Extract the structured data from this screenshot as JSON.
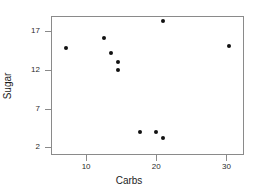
{
  "chart_data": {
    "type": "scatter",
    "title": "",
    "xlabel": "Carbs",
    "ylabel": "Sugar",
    "xlim": [
      5.0,
      32.5
    ],
    "ylim": [
      1.0,
      19.0
    ],
    "xticks": [
      10,
      20,
      30
    ],
    "yticks": [
      2,
      7,
      12,
      17
    ],
    "xtick_labels": [
      "10",
      "20",
      "30"
    ],
    "ytick_labels": [
      "2",
      "7",
      "12",
      "17"
    ],
    "grid": false,
    "legend": null,
    "marker": "filled-circle",
    "marker_color": "#111111",
    "frame_color": "#8a8a8a",
    "background": "#ffffff",
    "points": [
      {
        "x": 7.1,
        "y": 14.8
      },
      {
        "x": 12.6,
        "y": 16.1
      },
      {
        "x": 13.6,
        "y": 14.2
      },
      {
        "x": 14.6,
        "y": 13.1
      },
      {
        "x": 14.6,
        "y": 12.0
      },
      {
        "x": 17.7,
        "y": 4.0
      },
      {
        "x": 20.0,
        "y": 4.0
      },
      {
        "x": 21.0,
        "y": 18.3
      },
      {
        "x": 21.0,
        "y": 3.2
      },
      {
        "x": 30.4,
        "y": 15.1
      }
    ]
  }
}
